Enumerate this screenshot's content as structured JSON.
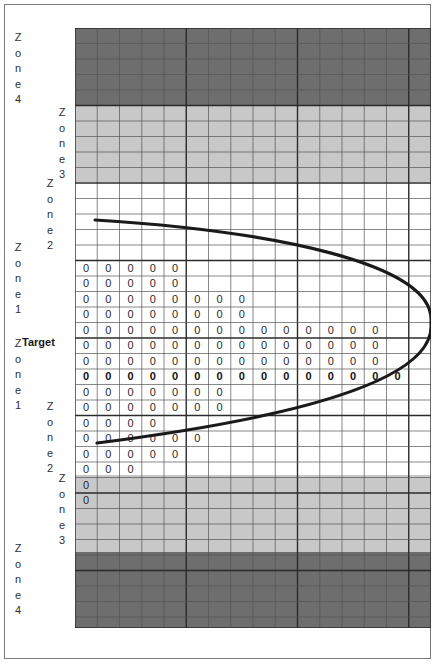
{
  "figure": {
    "title": "",
    "target_label": "Target",
    "grid": {
      "columns": 16,
      "rows": 39,
      "cell_width": 22.25,
      "cell_height": 15.5
    }
  },
  "colors": {
    "zone4": "#6e6e6e",
    "zone3": "#c8c8c8",
    "zone2": "#ffffff",
    "zone1": "#ffffff",
    "grid_line": "#555555",
    "grid_line_major": "#2b2b2b",
    "curve": "#1a1a1a",
    "border": "#7b7b7b",
    "text": "#2f2f2f",
    "page": "#ffffff"
  },
  "zone_labels": [
    {
      "id": "top-zone4",
      "text": "Zone4",
      "letters": [
        "Z",
        "o",
        "n",
        "e",
        "4"
      ],
      "x": 8,
      "y": 30
    },
    {
      "id": "top-zone3",
      "text": "Zone3",
      "letters": [
        "Z",
        "o",
        "n",
        "e",
        "3"
      ],
      "x": 52,
      "y": 105
    },
    {
      "id": "top-zone2",
      "text": "Zone2",
      "letters": [
        "Z",
        "o",
        "n",
        "e",
        "2"
      ],
      "x": 40,
      "y": 176
    },
    {
      "id": "top-zone1",
      "text": "Zone1",
      "letters": [
        "Z",
        "o",
        "n",
        "e",
        "1"
      ],
      "x": 8,
      "y": 240
    },
    {
      "id": "bot-zone1",
      "text": "Zone1",
      "letters": [
        "Z",
        "o",
        "n",
        "e",
        "1"
      ],
      "x": 8,
      "y": 336
    },
    {
      "id": "bot-zone2",
      "text": "Zone2",
      "letters": [
        "Z",
        "o",
        "n",
        "e",
        "2"
      ],
      "x": 40,
      "y": 399
    },
    {
      "id": "bot-zone3",
      "text": "Zone3",
      "letters": [
        "Z",
        "o",
        "n",
        "e",
        "3"
      ],
      "x": 52,
      "y": 471
    },
    {
      "id": "bot-zone4",
      "text": "Zone4",
      "letters": [
        "Z",
        "o",
        "n",
        "e",
        "4"
      ],
      "x": 8,
      "y": 541
    }
  ],
  "bands": [
    {
      "name": "zone4-top",
      "zone": 4,
      "top": 0,
      "height": 77,
      "fill": "#6e6e6e"
    },
    {
      "name": "zone3-top",
      "zone": 3,
      "top": 77,
      "height": 77,
      "fill": "#c8c8c8"
    },
    {
      "name": "zone2-top",
      "zone": 2,
      "top": 154,
      "height": 77,
      "fill": "#ffffff"
    },
    {
      "name": "zone1",
      "zone": 1,
      "top": 231,
      "height": 139,
      "fill": "#ffffff"
    },
    {
      "name": "zone2-bot",
      "zone": 2,
      "top": 370,
      "height": 77,
      "fill": "#ffffff"
    },
    {
      "name": "zone3-bot",
      "zone": 3,
      "top": 447,
      "height": 77,
      "fill": "#c8c8c8"
    },
    {
      "name": "zone4-bot",
      "zone": 4,
      "top": 524,
      "height": 76,
      "fill": "#6e6e6e"
    }
  ],
  "chart_data": {
    "type": "table",
    "xlabel": "",
    "ylabel": "",
    "grid": true,
    "legend": "none",
    "columns": 16,
    "marker": "0",
    "target_row_index": 19,
    "row_counts": [
      0,
      0,
      0,
      0,
      0,
      0,
      0,
      0,
      0,
      0,
      0,
      0,
      0,
      0,
      0,
      5,
      5,
      8,
      8,
      14,
      14,
      14,
      15,
      14,
      7,
      7,
      4,
      6,
      5,
      3,
      1,
      1,
      0,
      0,
      0,
      0,
      0,
      0,
      0
    ],
    "rows": [
      {
        "index": 0,
        "zone": 4,
        "zeros": 0,
        "bold": false
      },
      {
        "index": 1,
        "zone": 4,
        "zeros": 0,
        "bold": false
      },
      {
        "index": 2,
        "zone": 4,
        "zeros": 0,
        "bold": false
      },
      {
        "index": 3,
        "zone": 4,
        "zeros": 0,
        "bold": false
      },
      {
        "index": 4,
        "zone": 4,
        "zeros": 0,
        "bold": false
      },
      {
        "index": 5,
        "zone": 3,
        "zeros": 0,
        "bold": false
      },
      {
        "index": 6,
        "zone": 3,
        "zeros": 0,
        "bold": false
      },
      {
        "index": 7,
        "zone": 3,
        "zeros": 0,
        "bold": false
      },
      {
        "index": 8,
        "zone": 3,
        "zeros": 0,
        "bold": false
      },
      {
        "index": 9,
        "zone": 3,
        "zeros": 0,
        "bold": false
      },
      {
        "index": 10,
        "zone": 2,
        "zeros": 0,
        "bold": false
      },
      {
        "index": 11,
        "zone": 2,
        "zeros": 0,
        "bold": false
      },
      {
        "index": 12,
        "zone": 2,
        "zeros": 0,
        "bold": false
      },
      {
        "index": 13,
        "zone": 2,
        "zeros": 0,
        "bold": false
      },
      {
        "index": 14,
        "zone": 2,
        "zeros": 0,
        "bold": false
      },
      {
        "index": 15,
        "zone": 1,
        "zeros": 5,
        "bold": false
      },
      {
        "index": 16,
        "zone": 1,
        "zeros": 5,
        "bold": false
      },
      {
        "index": 17,
        "zone": 1,
        "zeros": 8,
        "bold": false
      },
      {
        "index": 18,
        "zone": 1,
        "zeros": 8,
        "bold": false
      },
      {
        "index": 19,
        "zone": 1,
        "zeros": 14,
        "bold": false
      },
      {
        "index": 20,
        "zone": 1,
        "zeros": 14,
        "bold": false
      },
      {
        "index": 21,
        "zone": 1,
        "zeros": 14,
        "bold": false
      },
      {
        "index": 22,
        "zone": 1,
        "zeros": 15,
        "bold": true
      },
      {
        "index": 23,
        "zone": 1,
        "zeros": 7,
        "bold": false
      },
      {
        "index": 24,
        "zone": 1,
        "zeros": 7,
        "bold": false
      },
      {
        "index": 25,
        "zone": 1,
        "zeros": 4,
        "bold": false
      },
      {
        "index": 26,
        "zone": 1,
        "zeros": 6,
        "bold": false
      },
      {
        "index": 27,
        "zone": 1,
        "zeros": 5,
        "bold": false
      },
      {
        "index": 28,
        "zone": 1,
        "zeros": 3,
        "bold": false
      },
      {
        "index": 29,
        "zone": 1,
        "zeros": 1,
        "bold": false
      },
      {
        "index": 30,
        "zone": 1,
        "zeros": 1,
        "bold": false
      },
      {
        "index": 31,
        "zone": 2,
        "zeros": 0,
        "bold": false
      },
      {
        "index": 32,
        "zone": 2,
        "zeros": 0,
        "bold": false
      },
      {
        "index": 33,
        "zone": 3,
        "zeros": 0,
        "bold": false
      },
      {
        "index": 34,
        "zone": 3,
        "zeros": 0,
        "bold": false
      },
      {
        "index": 35,
        "zone": 3,
        "zeros": 0,
        "bold": false
      },
      {
        "index": 36,
        "zone": 4,
        "zeros": 0,
        "bold": false
      },
      {
        "index": 37,
        "zone": 4,
        "zeros": 0,
        "bold": false
      },
      {
        "index": 38,
        "zone": 4,
        "zeros": 0,
        "bold": false
      }
    ],
    "curve": {
      "name": "parabolic-envelope",
      "orientation": "opens-left",
      "vertex_x": 356,
      "vertex_y": 295,
      "start": [
        20,
        192
      ],
      "end": [
        22,
        415
      ]
    }
  }
}
